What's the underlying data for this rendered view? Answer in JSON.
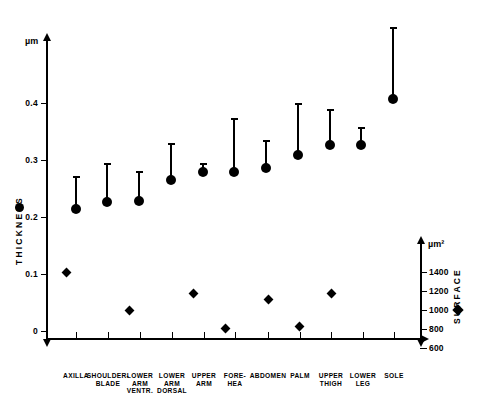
{
  "chart_data": {
    "type": "scatter",
    "title": "",
    "subtitle": "",
    "categories": [
      "AXILLA",
      "SHOULDER-\nBLADE",
      "LOWER\nARM\nVENTR.",
      "LOWER\nARM\nDORSAL",
      "UPPER\nARM",
      "FORE-\nHEA",
      "ABDOMEN",
      "PALM",
      "UPPER\nTHIGH",
      "LOWER\nLEG",
      "SOLE"
    ],
    "xlabel": "",
    "series": [
      {
        "name": "THICKNESS",
        "marker": "circle",
        "unit": "µm",
        "axis": "left",
        "values": [
          0.215,
          0.227,
          0.228,
          0.265,
          0.278,
          0.278,
          0.286,
          0.308,
          0.325,
          0.325,
          0.412
        ],
        "error_upper": [
          0.265,
          0.3,
          0.285,
          0.33,
          0.3,
          0.375,
          0.335,
          0.4,
          0.39,
          0.358,
          0.5
        ]
      },
      {
        "name": "SURFACE",
        "marker": "diamond",
        "unit": "µm²",
        "axis": "right",
        "values": [
          1230,
          960,
          1120,
          680,
          1040,
          1190,
          720,
          1190,
          null,
          null,
          null
        ]
      }
    ],
    "axes": {
      "left": {
        "unit": "µm",
        "title": "THICKNESS",
        "ticks": [
          "0.4",
          "0.3",
          "0.2",
          "0.1",
          "0"
        ],
        "tick_values": [
          0.4,
          0.3,
          0.2,
          0.1,
          0
        ],
        "range": [
          0,
          0.47
        ]
      },
      "right": {
        "unit": "µm²",
        "title": "SURFACE",
        "ticks": [
          "1400",
          "1200",
          "1000",
          "800",
          "600"
        ],
        "tick_values": [
          1400,
          1200,
          1000,
          800,
          600
        ],
        "range": [
          540,
          1480
        ]
      }
    },
    "grid": false,
    "legend": "inline-axis-markers"
  },
  "marks": {
    "thickness": [
      {
        "site": "AXILLA",
        "x": 76,
        "cy": 209,
        "top": 176
      },
      {
        "site": "SHOULDER-BLADE",
        "x": 107,
        "cy": 202,
        "top": 163
      },
      {
        "site": "LOWER ARM VENTR.",
        "x": 139,
        "cy": 201,
        "top": 171
      },
      {
        "site": "LOWER ARM DORSAL",
        "x": 171,
        "cy": 180,
        "top": 143
      },
      {
        "site": "UPPER ARM",
        "x": 203,
        "cy": 172,
        "top": 163
      },
      {
        "site": "FORE-HEA",
        "x": 234,
        "cy": 172,
        "top": 118
      },
      {
        "site": "ABDOMEN",
        "x": 266,
        "cy": 168,
        "top": 140
      },
      {
        "site": "PALM",
        "x": 298,
        "cy": 155,
        "top": 103
      },
      {
        "site": "UPPER THIGH",
        "x": 330,
        "cy": 145,
        "top": 109
      },
      {
        "site": "LOWER LEG",
        "x": 361,
        "cy": 145,
        "top": 127
      },
      {
        "site": "SOLE",
        "x": 393,
        "cy": 99,
        "top": 27
      }
    ],
    "surface": [
      {
        "site": "AXILLA",
        "x": 66,
        "cy": 272
      },
      {
        "site": "LOWER ARM VENTR.",
        "x": 129,
        "cy": 310
      },
      {
        "site": "UPPER ARM",
        "x": 193,
        "cy": 293
      },
      {
        "site": "FORE-HEA",
        "x": 225,
        "cy": 328
      },
      {
        "site": "ABDOMEN",
        "x": 268,
        "cy": 299
      },
      {
        "site": "PALM",
        "x": 299,
        "cy": 326
      },
      {
        "site": "UPPER THIGH",
        "x": 331,
        "cy": 293
      }
    ]
  },
  "axis_left": {
    "unit": "µm",
    "title": "THICKNESS",
    "ticks": [
      {
        "label": "0.4",
        "y": 103
      },
      {
        "label": "0.3",
        "y": 160
      },
      {
        "label": "0.2",
        "y": 217
      },
      {
        "label": "0.1",
        "y": 274
      },
      {
        "label": "0",
        "y": 331
      }
    ]
  },
  "axis_right": {
    "unit": "µm²",
    "title": "SURFACE",
    "ticks": [
      {
        "label": "1400",
        "y": 272
      },
      {
        "label": "1200",
        "y": 291
      },
      {
        "label": "1000",
        "y": 310
      },
      {
        "label": "800",
        "y": 329
      },
      {
        "label": "600",
        "y": 348
      }
    ]
  },
  "x_axis": {
    "labels": [
      {
        "text": "AXILLA",
        "x": 76
      },
      {
        "text": "SHOULDER-\nBLADE",
        "x": 108
      },
      {
        "text": "LOWER\nARM\nVENTR.",
        "x": 140
      },
      {
        "text": "LOWER\nARM\nDORSAL",
        "x": 172
      },
      {
        "text": "UPPER\nARM",
        "x": 204
      },
      {
        "text": "FORE-\nHEA",
        "x": 235
      },
      {
        "text": "ABDOMEN",
        "x": 268
      },
      {
        "text": "PALM",
        "x": 300
      },
      {
        "text": "UPPER\nTHIGH",
        "x": 331
      },
      {
        "text": "LOWER\nLEG",
        "x": 363
      },
      {
        "text": "SOLE",
        "x": 394
      }
    ]
  }
}
